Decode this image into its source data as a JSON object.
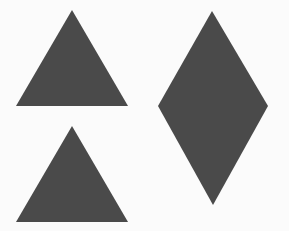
{
  "canvas": {
    "width": 289,
    "height": 231,
    "background": "#fbfbfb"
  },
  "shapes": [
    {
      "id": "top-left-triangle",
      "type": "triangle",
      "fill": "#4a4a4a",
      "points": "72,10 16,106 128,106"
    },
    {
      "id": "bottom-left-triangle",
      "type": "triangle",
      "fill": "#4a4a4a",
      "points": "72,126 16,222 128,222"
    },
    {
      "id": "right-diamond",
      "type": "diamond",
      "fill": "#4a4a4a",
      "points": "212,11 268,106 213,205 158,106"
    }
  ]
}
